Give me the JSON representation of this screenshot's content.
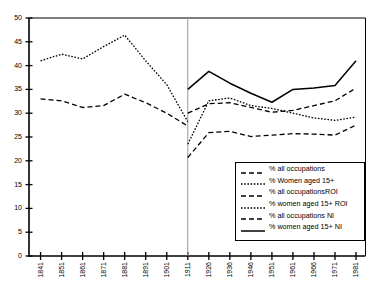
{
  "chart_data": {
    "type": "line",
    "title": "",
    "subtitle": "",
    "xlabel": "",
    "ylabel": "",
    "ylim": [
      0,
      50
    ],
    "ytick_step": 5,
    "yticks": [
      "0",
      "5",
      "10",
      "15",
      "20",
      "25",
      "30",
      "35",
      "40",
      "45",
      "50"
    ],
    "grid": false,
    "legend_position": "lower-right",
    "categories": [
      "1841",
      "1851",
      "1861",
      "1871",
      "1881",
      "1891",
      "1901",
      "1911",
      "1926",
      "1936",
      "1946",
      "1951",
      "1961",
      "1966",
      "1971",
      "1981"
    ],
    "annotations": [
      {
        "name": "partition-line",
        "type": "vline",
        "at": "1911",
        "color": "#999999"
      }
    ],
    "series": [
      {
        "name": "% all occupations",
        "style": "dashed",
        "color": "#000000",
        "x": [
          "1841",
          "1851",
          "1861",
          "1871",
          "1881",
          "1891",
          "1901",
          "1911"
        ],
        "values": [
          33.0,
          32.6,
          31.2,
          31.6,
          34.0,
          32.2,
          30.0,
          27.3
        ]
      },
      {
        "name": "% Women aged 15+",
        "style": "dotted",
        "color": "#000000",
        "x": [
          "1841",
          "1851",
          "1861",
          "1871",
          "1881",
          "1891",
          "1901",
          "1911"
        ],
        "values": [
          41.0,
          42.4,
          41.4,
          44.0,
          46.4,
          41.0,
          36.0,
          28.2
        ]
      },
      {
        "name": "% all occupationsROI",
        "style": "dashed",
        "color": "#000000",
        "x": [
          "1911",
          "1926",
          "1936",
          "1946",
          "1951",
          "1961",
          "1966",
          "1971",
          "1981"
        ],
        "values": [
          30.0,
          32.0,
          32.2,
          31.2,
          30.2,
          30.6,
          31.6,
          32.6,
          35.3
        ]
      },
      {
        "name": "% women aged 15+ ROI",
        "style": "dotted",
        "color": "#000000",
        "x": [
          "1911",
          "1926",
          "1936",
          "1946",
          "1951",
          "1961",
          "1966",
          "1971",
          "1981"
        ],
        "values": [
          23.5,
          32.6,
          33.2,
          31.6,
          31.0,
          30.0,
          29.0,
          28.5,
          29.2
        ]
      },
      {
        "name": "% all occupations NI",
        "style": "dashed",
        "color": "#000000",
        "x": [
          "1911",
          "1926",
          "1936",
          "1946",
          "1951",
          "1961",
          "1966",
          "1971",
          "1981"
        ],
        "values": [
          20.7,
          25.9,
          26.2,
          25.1,
          25.4,
          25.7,
          25.6,
          25.4,
          27.5
        ]
      },
      {
        "name": "% women aged 15+ NI",
        "style": "solid",
        "color": "#000000",
        "x": [
          "1911",
          "1926",
          "1936",
          "1946",
          "1951",
          "1961",
          "1966",
          "1971",
          "1981"
        ],
        "values": [
          35.0,
          38.8,
          36.3,
          34.2,
          32.3,
          35.0,
          35.3,
          35.8,
          41.0
        ]
      }
    ]
  },
  "legend": {
    "entries": [
      {
        "label": "% all occupations",
        "style": "dashed"
      },
      {
        "label": "% Women aged 15+",
        "style": "dotted"
      },
      {
        "label": "% all occupationsROI",
        "style": "dashed"
      },
      {
        "label": "% women aged 15+ ROI",
        "style": "dotted"
      },
      {
        "label": "% all occupations NI",
        "style": "dashed"
      },
      {
        "label": "% women aged 15+ NI",
        "style": "solid"
      }
    ]
  }
}
